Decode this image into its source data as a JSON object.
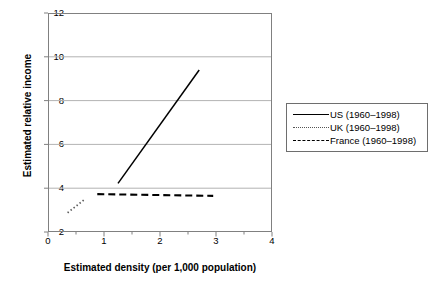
{
  "chart_data": {
    "type": "line",
    "title": "",
    "xlabel": "Estimated density (per 1,000 population)",
    "ylabel": "Estimated relative income",
    "xlim": [
      0,
      4
    ],
    "ylim": [
      2,
      12
    ],
    "xticks": [
      "0",
      "1",
      "2",
      "3",
      "4"
    ],
    "xtick_values": [
      0,
      1,
      2,
      3,
      4
    ],
    "xminor_tick_values": [
      0.5,
      1.5,
      2.5,
      3.5
    ],
    "yticks": [
      "2",
      "4",
      "6",
      "8",
      "10",
      "12"
    ],
    "ytick_values": [
      2,
      4,
      6,
      8,
      10,
      12
    ],
    "gridlines": {
      "horizontal": [
        4,
        6,
        8,
        10
      ],
      "vertical": []
    },
    "grid": true,
    "legend_position": "right-outside",
    "series": [
      {
        "name": "US (1960–1998)",
        "style": "solid",
        "color": "#000000",
        "x": [
          1.25,
          2.7
        ],
        "y": [
          4.22,
          9.4
        ]
      },
      {
        "name": "UK (1960–1998)",
        "style": "dotted",
        "color": "#555555",
        "x": [
          0.35,
          0.66
        ],
        "y": [
          2.88,
          3.5
        ]
      },
      {
        "name": "France (1960–1998)",
        "style": "dashed",
        "color": "#000000",
        "x": [
          0.88,
          2.95
        ],
        "y": [
          3.73,
          3.65
        ]
      }
    ]
  },
  "legend": {
    "items": [
      {
        "label": "US (1960–1998)",
        "style": "solid"
      },
      {
        "label": "UK (1960–1998)",
        "style": "dotted"
      },
      {
        "label": "France (1960–1998)",
        "style": "dashed"
      }
    ]
  },
  "axes": {
    "x_title": "Estimated density (per 1,000 population)",
    "y_title": "Estimated relative income"
  }
}
